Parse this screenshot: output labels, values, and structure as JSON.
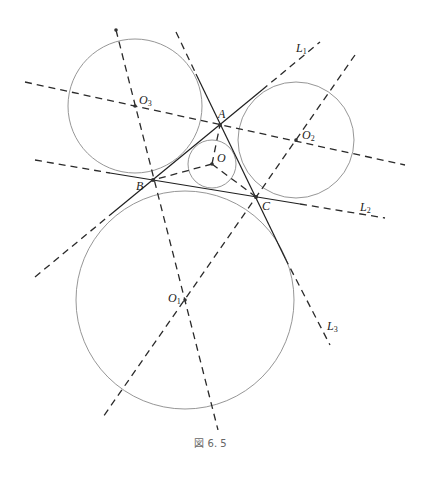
{
  "figure": {
    "caption": "図 6. 5",
    "points": {
      "A": {
        "label": "A",
        "x": 220,
        "y": 125
      },
      "B": {
        "label": "B",
        "x": 153,
        "y": 180
      },
      "C": {
        "label": "C",
        "x": 256,
        "y": 197
      },
      "O": {
        "label": "O",
        "x": 212,
        "y": 164
      },
      "O1": {
        "label": "O",
        "sub": "1",
        "x": 185,
        "y": 300
      },
      "O2": {
        "label": "O",
        "sub": "2",
        "x": 296,
        "y": 140
      },
      "O3": {
        "label": "O",
        "sub": "3",
        "x": 135,
        "y": 106
      }
    },
    "circles": [
      {
        "name": "incircle",
        "center": "O",
        "r": 24
      },
      {
        "name": "excircle-1",
        "center": "O1",
        "r": 109
      },
      {
        "name": "excircle-2",
        "center": "O2",
        "r": 58
      },
      {
        "name": "excircle-3",
        "center": "O3",
        "r": 67
      }
    ],
    "line_labels": {
      "L1": {
        "label": "L",
        "sub": "1"
      },
      "L2": {
        "label": "L",
        "sub": "2"
      },
      "L3": {
        "label": "L",
        "sub": "3"
      }
    }
  }
}
